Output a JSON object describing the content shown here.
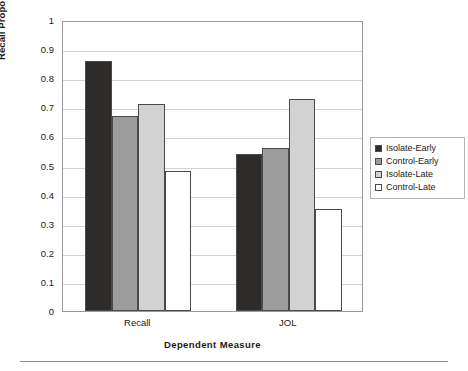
{
  "chart_data": {
    "type": "bar",
    "title": "",
    "xlabel": "Dependent Measure",
    "ylabel": "Recall Proportion/JOL Number",
    "categories": [
      "Recall",
      "JOL"
    ],
    "ylim": [
      0,
      1
    ],
    "ytick_labels": [
      "1",
      "0.9",
      "0.8",
      "0.7",
      "0.6",
      "0.5",
      "0.4",
      "0.3",
      "0.2",
      "0.1",
      "0"
    ],
    "ytick_values": [
      1,
      0.9,
      0.8,
      0.7,
      0.6,
      0.5,
      0.4,
      0.3,
      0.2,
      0.1,
      0
    ],
    "grid": "horizontal",
    "legend_position": "right",
    "series": [
      {
        "name": "Isolate-Early",
        "color": "#2e2c2a",
        "values": [
          0.86,
          0.54
        ]
      },
      {
        "name": "Control-Early",
        "color": "#9d9d9d",
        "values": [
          0.67,
          0.56
        ]
      },
      {
        "name": "Isolate-Late",
        "color": "#d2d2d2",
        "values": [
          0.71,
          0.73
        ]
      },
      {
        "name": "Control-Late",
        "color": "#ffffff",
        "values": [
          0.48,
          0.35
        ]
      }
    ]
  },
  "legend": {
    "items": [
      {
        "label": "Isolate-Early"
      },
      {
        "label": "Control-Early"
      },
      {
        "label": "Isolate-Late"
      },
      {
        "label": "Control-Late"
      }
    ]
  },
  "colors": {
    "axis": "#9a9a9a",
    "gridline": "#d2d2d2",
    "bar_outline": "#4a4a4a",
    "text": "#1a1a1a"
  }
}
